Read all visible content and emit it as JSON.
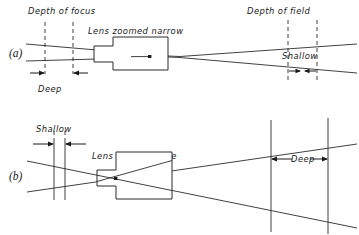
{
  "figure": {
    "background_color": "#ffffff",
    "line_color": "#2b2b2b",
    "text_color": "#1a1a1a"
  },
  "panels": [
    {
      "id": "a",
      "label": "(a)",
      "lens_label": "Lens zoomed narrow",
      "left_caption": "Depth of focus",
      "left_measure": "Deep",
      "right_caption": "Depth of field",
      "right_measure": "Shallow",
      "left_line_style": "dashed",
      "right_line_style": "dashed",
      "left_gap_px": 28,
      "right_gap_px": 29,
      "cone_description": "narrow converging cone on image side, very shallow angle on object side"
    },
    {
      "id": "b",
      "label": "(b)",
      "lens_label": "Lens zoomed wide",
      "left_caption": "",
      "left_measure": "Shallow",
      "right_caption": "",
      "right_measure": "Deep",
      "left_line_style": "solid",
      "right_line_style": "solid",
      "left_gap_px": 11,
      "right_gap_px": 57,
      "cone_description": "wide diverging cone on object side, narrow crossing at lens"
    }
  ],
  "icons": {
    "focus_point": "focus-dot-icon",
    "arrow_left": "arrow-left-icon",
    "arrow_right": "arrow-right-icon"
  }
}
